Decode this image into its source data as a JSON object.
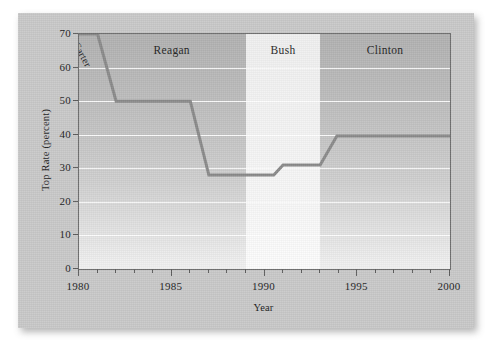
{
  "chart_data": {
    "type": "line",
    "title": "",
    "xlabel": "Year",
    "ylabel": "Top Rate (percent)",
    "xlim": [
      1980,
      2000
    ],
    "ylim": [
      0,
      70
    ],
    "xticks_major": [
      1980,
      1985,
      1990,
      1995,
      2000
    ],
    "xticks_major_labels": [
      "1980",
      "1985",
      "1990",
      "1995",
      "2000"
    ],
    "xticks_minor_step": 1,
    "yticks": [
      0,
      10,
      20,
      30,
      40,
      50,
      60,
      70
    ],
    "ytick_labels": [
      "0",
      "10",
      "20",
      "30",
      "40",
      "50",
      "60",
      "70"
    ],
    "grid": "horizontal-white",
    "legend": "none",
    "series": [
      {
        "name": "Top marginal income tax rate",
        "color": "#8a8a8a",
        "x": [
          1980,
          1981,
          1982,
          1986,
          1987,
          1990.5,
          1991,
          1992.6,
          1993,
          1993.9,
          2000
        ],
        "values": [
          70,
          70,
          50,
          50,
          28,
          28,
          31,
          31,
          31,
          39.6,
          39.6
        ]
      }
    ],
    "bands": [
      {
        "label": "Carter",
        "start": 1980,
        "end": 1981,
        "shade": "dark",
        "label_rotated": true
      },
      {
        "label": "Reagan",
        "start": 1981,
        "end": 1989,
        "shade": "dark",
        "label_rotated": false
      },
      {
        "label": "Bush",
        "start": 1989,
        "end": 1993,
        "shade": "light",
        "label_rotated": false
      },
      {
        "label": "Clinton",
        "start": 1993,
        "end": 2000,
        "shade": "dark",
        "label_rotated": false
      }
    ],
    "colors": {
      "line": "#8a8a8a",
      "band_dark": "#b8b8b8",
      "band_light": "#f5f5f5",
      "gridline": "#ffffff",
      "axis": "#6a6a6a",
      "card_background": "#c9c9c9",
      "page_background": "#ffffff"
    }
  }
}
